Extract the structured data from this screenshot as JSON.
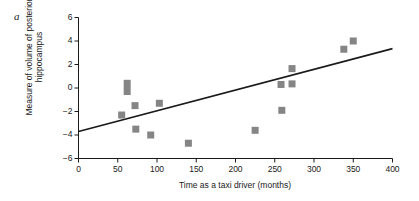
{
  "panel": {
    "label": "a"
  },
  "chart_data": {
    "type": "scatter",
    "title": "",
    "xlabel": "Time as a taxi driver (months)",
    "ylabel": "Measure of volume of posterior hippocampus",
    "xlim": [
      0,
      400
    ],
    "ylim": [
      -6,
      6
    ],
    "xticks": [
      0,
      50,
      100,
      150,
      200,
      250,
      300,
      350,
      400
    ],
    "yticks": [
      -6,
      -4,
      -2,
      0,
      2,
      4,
      6
    ],
    "xtick_labels": [
      "0",
      "50",
      "100",
      "150",
      "200",
      "250",
      "300",
      "350",
      "400"
    ],
    "ytick_labels": [
      "−6",
      "−4",
      "−2",
      "0",
      "2",
      "4",
      "6"
    ],
    "grid": false,
    "legend": null,
    "marker_color": "#858585",
    "marker_shape": "square",
    "line_color": "#1a1a1a",
    "points": [
      {
        "x": 55,
        "y": -2.3
      },
      {
        "x": 62,
        "y": 0.4
      },
      {
        "x": 62,
        "y": -0.3
      },
      {
        "x": 72,
        "y": -1.5
      },
      {
        "x": 73,
        "y": -3.5
      },
      {
        "x": 92,
        "y": -4.0
      },
      {
        "x": 103,
        "y": -1.3
      },
      {
        "x": 140,
        "y": -4.7
      },
      {
        "x": 225,
        "y": -3.6
      },
      {
        "x": 258,
        "y": 0.3
      },
      {
        "x": 259,
        "y": -1.9
      },
      {
        "x": 272,
        "y": 1.65
      },
      {
        "x": 272,
        "y": 0.35
      },
      {
        "x": 338,
        "y": 3.3
      },
      {
        "x": 350,
        "y": 4.0
      }
    ],
    "trendline": {
      "type": "linear",
      "x_start": 0,
      "y_start": -3.7,
      "x_end": 400,
      "y_end": 3.35
    }
  }
}
